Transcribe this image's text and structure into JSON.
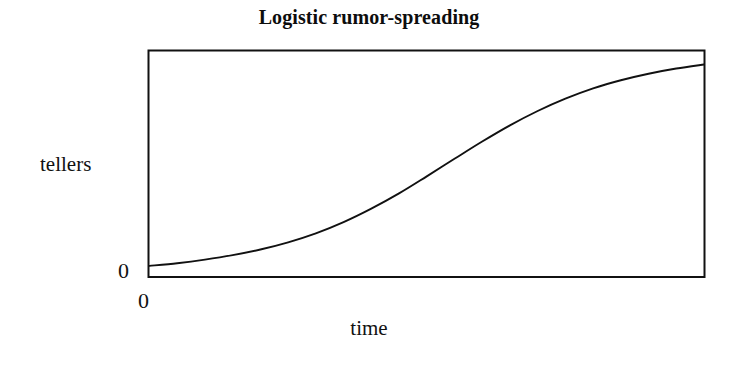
{
  "figure": {
    "title": "Logistic rumor-spreading",
    "background_color": "#ffffff",
    "ink_color": "#111111"
  },
  "axes": {
    "ylabel": "tellers",
    "xlabel": "time",
    "y_origin_tick": "0",
    "x_origin_tick": "0"
  },
  "chart_data": {
    "type": "line",
    "title": "Logistic rumor-spreading",
    "xlabel": "time",
    "ylabel": "tellers",
    "grid": false,
    "legend": null,
    "axis_ticks": {
      "x": [
        "0"
      ],
      "y": [
        "0"
      ]
    },
    "xlim": [
      0,
      1
    ],
    "ylim": [
      0,
      1
    ],
    "series": [
      {
        "name": "tellers",
        "color": "#111111",
        "x": [
          0.0,
          0.05,
          0.1,
          0.15,
          0.2,
          0.25,
          0.3,
          0.35,
          0.4,
          0.45,
          0.5,
          0.55,
          0.6,
          0.65,
          0.7,
          0.75,
          0.8,
          0.85,
          0.9,
          0.95,
          1.0
        ],
        "y": [
          0.045,
          0.057,
          0.073,
          0.093,
          0.118,
          0.15,
          0.19,
          0.24,
          0.3,
          0.368,
          0.444,
          0.522,
          0.599,
          0.671,
          0.735,
          0.79,
          0.836,
          0.872,
          0.901,
          0.924,
          0.942
        ]
      }
    ]
  }
}
